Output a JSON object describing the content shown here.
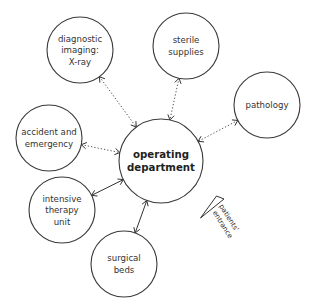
{
  "diagram": {
    "title": "",
    "central_node": {
      "id": "operating_department",
      "lines": [
        "operating",
        "department"
      ],
      "cx": 161,
      "cy": 161,
      "r": 42
    },
    "nodes": [
      {
        "id": "diagnostic_imaging",
        "lines": [
          "diagnostic",
          "imaging:",
          "X-ray"
        ],
        "cx": 80,
        "cy": 50,
        "r": 33
      },
      {
        "id": "sterile_supplies",
        "lines": [
          "sterile",
          "supplies"
        ],
        "cx": 186,
        "cy": 46,
        "r": 33
      },
      {
        "id": "pathology",
        "lines": [
          "pathology"
        ],
        "cx": 267,
        "cy": 105,
        "r": 33
      },
      {
        "id": "accident_and_emergency",
        "lines": [
          "accident and",
          "emergency"
        ],
        "cx": 49,
        "cy": 138,
        "r": 33
      },
      {
        "id": "intensive_therapy_unit",
        "lines": [
          "intensive",
          "therapy",
          "unit"
        ],
        "cx": 62,
        "cy": 210,
        "r": 33
      },
      {
        "id": "surgical_beds",
        "lines": [
          "surgical",
          "beds"
        ],
        "cx": 124,
        "cy": 264,
        "r": 33
      }
    ],
    "links": [
      {
        "from": "diagnostic_imaging",
        "to": "operating_department",
        "style": "dotted",
        "arrows": "both"
      },
      {
        "from": "sterile_supplies",
        "to": "operating_department",
        "style": "dotted",
        "arrows": "both"
      },
      {
        "from": "pathology",
        "to": "operating_department",
        "style": "dotted",
        "arrows": "both"
      },
      {
        "from": "accident_and_emergency",
        "to": "operating_department",
        "style": "dotted",
        "arrows": "both"
      },
      {
        "from": "intensive_therapy_unit",
        "to": "operating_department",
        "style": "solid",
        "arrows": "both"
      },
      {
        "from": "surgical_beds",
        "to": "operating_department",
        "style": "solid",
        "arrows": "both"
      }
    ],
    "legend": {
      "entrance_label_lines": [
        "patients'",
        "entrance"
      ],
      "entrance_icon": "triangle-wedge-icon"
    }
  }
}
